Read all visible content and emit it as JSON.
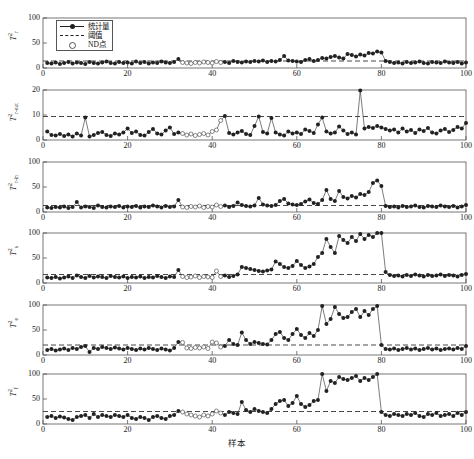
{
  "figure": {
    "xlabel": "样本",
    "caption": "",
    "x_ticks": [
      0,
      20,
      40,
      60,
      80,
      100
    ],
    "xlim": [
      0,
      100
    ],
    "legend": {
      "position": "top-left-panel-1",
      "entries": [
        {
          "key": "statistic",
          "label": "统计量",
          "symbol": "line-with-filled-circle"
        },
        {
          "key": "threshold",
          "label": "阈值",
          "symbol": "dashed-line"
        },
        {
          "key": "nd_point",
          "label": "ND点",
          "symbol": "open-circle"
        }
      ]
    },
    "colors": {
      "marker": "#222222",
      "line": "#444444",
      "threshold": "#333333",
      "axis": "#555555",
      "background": "#ffffff"
    }
  },
  "chart_data": [
    {
      "type": "line",
      "id": "panel-1",
      "title": "",
      "ylabel": "T²_r",
      "ylabel_base": "T",
      "ylabel_sup": "2",
      "ylabel_sub": "r",
      "xlabel": "样本",
      "ylim": [
        0,
        100
      ],
      "y_ticks": [
        0,
        50,
        100
      ],
      "xlim": [
        0,
        100
      ],
      "grid": false,
      "threshold": 14,
      "nd_range": [
        33,
        42
      ],
      "x": [
        1,
        2,
        3,
        4,
        5,
        6,
        7,
        8,
        9,
        10,
        11,
        12,
        13,
        14,
        15,
        16,
        17,
        18,
        19,
        20,
        21,
        22,
        23,
        24,
        25,
        26,
        27,
        28,
        29,
        30,
        31,
        32,
        33,
        34,
        35,
        36,
        37,
        38,
        39,
        40,
        41,
        42,
        43,
        44,
        45,
        46,
        47,
        48,
        49,
        50,
        51,
        52,
        53,
        54,
        55,
        56,
        57,
        58,
        59,
        60,
        61,
        62,
        63,
        64,
        65,
        66,
        67,
        68,
        69,
        70,
        71,
        72,
        73,
        74,
        75,
        76,
        77,
        78,
        79,
        80,
        81,
        82,
        83,
        84,
        85,
        86,
        87,
        88,
        89,
        90,
        91,
        92,
        93,
        94,
        95,
        96,
        97,
        98,
        99,
        100
      ],
      "values": [
        10,
        9,
        11,
        8,
        10,
        12,
        9,
        11,
        10,
        8,
        12,
        10,
        9,
        11,
        13,
        10,
        9,
        12,
        10,
        11,
        9,
        13,
        10,
        12,
        9,
        11,
        10,
        13,
        11,
        10,
        12,
        18,
        11,
        10,
        9,
        11,
        10,
        12,
        11,
        10,
        13,
        11,
        12,
        10,
        14,
        12,
        11,
        13,
        12,
        14,
        13,
        15,
        12,
        14,
        13,
        16,
        24,
        15,
        14,
        13,
        12,
        16,
        18,
        14,
        16,
        20,
        19,
        22,
        24,
        21,
        19,
        28,
        26,
        23,
        27,
        25,
        30,
        29,
        33,
        31,
        36,
        42,
        39,
        46,
        52,
        48,
        63,
        88,
        66,
        58,
        79,
        72,
        86,
        83,
        94,
        90,
        96,
        93,
        99,
        100
      ],
      "values_after_fault": [
        14,
        12,
        10,
        11,
        9,
        12,
        10,
        11,
        13,
        10,
        9,
        12,
        11,
        10,
        13,
        11,
        10,
        12,
        9,
        11
      ],
      "fault_index": 80
    },
    {
      "type": "line",
      "id": "panel-2",
      "title": "",
      "ylabel": "T²_r-out",
      "ylabel_base": "T",
      "ylabel_sup": "2",
      "ylabel_sub": "r-out",
      "xlabel": "样本",
      "ylim": [
        0,
        20
      ],
      "y_ticks": [
        0,
        10,
        20
      ],
      "xlim": [
        0,
        100
      ],
      "grid": false,
      "threshold": 9.4,
      "nd_range": [
        33,
        42
      ],
      "x": [
        1,
        2,
        3,
        4,
        5,
        6,
        7,
        8,
        9,
        10,
        11,
        12,
        13,
        14,
        15,
        16,
        17,
        18,
        19,
        20,
        21,
        22,
        23,
        24,
        25,
        26,
        27,
        28,
        29,
        30,
        31,
        32,
        33,
        34,
        35,
        36,
        37,
        38,
        39,
        40,
        41,
        42,
        43,
        44,
        45,
        46,
        47,
        48,
        49,
        50,
        51,
        52,
        53,
        54,
        55,
        56,
        57,
        58,
        59,
        60,
        61,
        62,
        63,
        64,
        65,
        66,
        67,
        68,
        69,
        70,
        71,
        72,
        73,
        74,
        75,
        76,
        77,
        78,
        79,
        80,
        81,
        82,
        83,
        84,
        85,
        86,
        87,
        88,
        89,
        90,
        91,
        92,
        93,
        94,
        95,
        96,
        97,
        98,
        99,
        100
      ],
      "values": [
        3.4,
        2.0,
        1.8,
        2.4,
        1.6,
        2.2,
        1.4,
        2.6,
        1.8,
        9.0,
        1.4,
        2.0,
        2.8,
        3.2,
        2.0,
        1.6,
        2.6,
        2.2,
        3.0,
        4.6,
        2.8,
        3.4,
        2.0,
        1.8,
        3.2,
        4.4,
        2.6,
        2.2,
        3.8,
        5.0,
        2.4,
        3.0,
        2.6,
        2.0,
        2.4,
        1.8,
        2.2,
        2.6,
        2.0,
        3.4,
        4.0,
        7.8,
        9.6,
        2.8,
        2.2,
        3.0,
        3.6,
        2.4,
        2.0,
        5.6,
        9.4,
        3.2,
        2.6,
        8.8,
        3.0,
        2.2,
        1.8,
        3.4,
        2.6,
        3.0,
        2.4,
        4.2,
        3.6,
        2.8,
        6.2,
        9.0,
        3.4,
        2.6,
        3.0,
        5.4,
        3.8,
        2.4,
        3.0,
        2.2,
        19.8,
        4.6,
        5.2,
        4.8,
        5.6,
        5.0,
        4.4,
        3.8,
        4.2,
        3.0,
        4.6,
        3.4,
        4.0,
        2.8,
        4.2,
        3.6,
        4.8,
        3.0,
        2.6,
        3.8,
        4.4,
        3.2,
        4.0,
        5.2,
        4.6,
        6.8
      ],
      "fault_index": null
    },
    {
      "type": "line",
      "id": "panel-3",
      "title": "",
      "ylabel": "T²_r-in",
      "ylabel_base": "T",
      "ylabel_sup": "2",
      "ylabel_sub": "r-in",
      "xlabel": "样本",
      "ylim": [
        0,
        100
      ],
      "y_ticks": [
        0,
        50,
        100
      ],
      "xlim": [
        0,
        100
      ],
      "grid": false,
      "threshold": 13,
      "nd_range": [
        33,
        42
      ],
      "x": [
        1,
        2,
        3,
        4,
        5,
        6,
        7,
        8,
        9,
        10,
        11,
        12,
        13,
        14,
        15,
        16,
        17,
        18,
        19,
        20,
        21,
        22,
        23,
        24,
        25,
        26,
        27,
        28,
        29,
        30,
        31,
        32,
        33,
        34,
        35,
        36,
        37,
        38,
        39,
        40,
        41,
        42,
        43,
        44,
        45,
        46,
        47,
        48,
        49,
        50,
        51,
        52,
        53,
        54,
        55,
        56,
        57,
        58,
        59,
        60,
        61,
        62,
        63,
        64,
        65,
        66,
        67,
        68,
        69,
        70,
        71,
        72,
        73,
        74,
        75,
        76,
        77,
        78,
        79,
        80,
        81,
        82,
        83,
        84,
        85,
        86,
        87,
        88,
        89,
        90,
        91,
        92,
        93,
        94,
        95,
        96,
        97,
        98,
        99,
        100
      ],
      "values": [
        9,
        8,
        10,
        9,
        11,
        8,
        10,
        20,
        9,
        11,
        10,
        8,
        13,
        10,
        9,
        11,
        10,
        12,
        9,
        11,
        10,
        12,
        9,
        11,
        10,
        13,
        11,
        9,
        12,
        10,
        11,
        24,
        10,
        9,
        11,
        10,
        12,
        9,
        11,
        10,
        14,
        11,
        13,
        10,
        12,
        19,
        14,
        12,
        11,
        13,
        28,
        15,
        13,
        12,
        14,
        22,
        26,
        17,
        15,
        14,
        16,
        21,
        25,
        18,
        16,
        24,
        44,
        26,
        22,
        42,
        30,
        27,
        32,
        29,
        36,
        34,
        40,
        58,
        63,
        52,
        12,
        10,
        11,
        9,
        12,
        10,
        11,
        13,
        10,
        9,
        12,
        11,
        10,
        13,
        11,
        10,
        12,
        9,
        11,
        14
      ],
      "fault_index": 80
    },
    {
      "type": "line",
      "id": "panel-4",
      "title": "",
      "ylabel": "T²_s",
      "ylabel_base": "T",
      "ylabel_sup": "2",
      "ylabel_sub": "s",
      "xlabel": "样本",
      "ylim": [
        0,
        100
      ],
      "y_ticks": [
        0,
        50,
        100
      ],
      "xlim": [
        0,
        100
      ],
      "grid": false,
      "threshold": 17,
      "nd_range": [
        33,
        42
      ],
      "x": [
        1,
        2,
        3,
        4,
        5,
        6,
        7,
        8,
        9,
        10,
        11,
        12,
        13,
        14,
        15,
        16,
        17,
        18,
        19,
        20,
        21,
        22,
        23,
        24,
        25,
        26,
        27,
        28,
        29,
        30,
        31,
        32,
        33,
        34,
        35,
        36,
        37,
        38,
        39,
        40,
        41,
        42,
        43,
        44,
        45,
        46,
        47,
        48,
        49,
        50,
        51,
        52,
        53,
        54,
        55,
        56,
        57,
        58,
        59,
        60,
        61,
        62,
        63,
        64,
        65,
        66,
        67,
        68,
        69,
        70,
        71,
        72,
        73,
        74,
        75,
        76,
        77,
        78,
        79,
        80,
        81,
        82,
        83,
        84,
        85,
        86,
        87,
        88,
        89,
        90,
        91,
        92,
        93,
        94,
        95,
        96,
        97,
        98,
        99,
        100
      ],
      "values": [
        11,
        10,
        12,
        9,
        11,
        13,
        10,
        15,
        12,
        10,
        14,
        11,
        13,
        12,
        10,
        14,
        12,
        11,
        13,
        10,
        12,
        11,
        13,
        10,
        12,
        11,
        14,
        12,
        10,
        13,
        12,
        26,
        13,
        11,
        12,
        14,
        11,
        13,
        12,
        11,
        24,
        13,
        15,
        12,
        14,
        17,
        32,
        30,
        28,
        26,
        24,
        23,
        25,
        27,
        43,
        38,
        32,
        30,
        34,
        44,
        36,
        30,
        33,
        38,
        52,
        60,
        88,
        72,
        60,
        94,
        86,
        80,
        92,
        84,
        98,
        88,
        96,
        92,
        100,
        100,
        22,
        16,
        14,
        15,
        13,
        16,
        14,
        17,
        15,
        13,
        16,
        14,
        15,
        17,
        14,
        16,
        15,
        13,
        16,
        18
      ],
      "fault_index": 80
    },
    {
      "type": "line",
      "id": "panel-5",
      "title": "",
      "ylabel": "T²_e",
      "ylabel_base": "T",
      "ylabel_sup": "2",
      "ylabel_sub": "e",
      "xlabel": "样本",
      "ylim": [
        0,
        100
      ],
      "y_ticks": [
        0,
        50,
        100
      ],
      "xlim": [
        0,
        100
      ],
      "grid": false,
      "threshold": 20,
      "nd_range": [
        33,
        42
      ],
      "x": [
        1,
        2,
        3,
        4,
        5,
        6,
        7,
        8,
        9,
        10,
        11,
        12,
        13,
        14,
        15,
        16,
        17,
        18,
        19,
        20,
        21,
        22,
        23,
        24,
        25,
        26,
        27,
        28,
        29,
        30,
        31,
        32,
        33,
        34,
        35,
        36,
        37,
        38,
        39,
        40,
        41,
        42,
        43,
        44,
        45,
        46,
        47,
        48,
        49,
        50,
        51,
        52,
        53,
        54,
        55,
        56,
        57,
        58,
        59,
        60,
        61,
        62,
        63,
        64,
        65,
        66,
        67,
        68,
        69,
        70,
        71,
        72,
        73,
        74,
        75,
        76,
        77,
        78,
        79,
        80,
        81,
        82,
        83,
        84,
        85,
        86,
        87,
        88,
        89,
        90,
        91,
        92,
        93,
        94,
        95,
        96,
        97,
        98,
        99,
        100
      ],
      "values": [
        10,
        12,
        9,
        11,
        13,
        10,
        14,
        12,
        16,
        18,
        6,
        14,
        12,
        16,
        14,
        12,
        15,
        13,
        11,
        14,
        12,
        10,
        13,
        11,
        14,
        12,
        10,
        13,
        11,
        9,
        14,
        26,
        25,
        14,
        13,
        15,
        14,
        16,
        13,
        26,
        24,
        16,
        18,
        30,
        22,
        20,
        45,
        30,
        22,
        26,
        24,
        22,
        21,
        30,
        42,
        46,
        34,
        30,
        42,
        52,
        40,
        34,
        44,
        38,
        50,
        98,
        62,
        72,
        96,
        82,
        74,
        76,
        86,
        92,
        76,
        88,
        80,
        92,
        98,
        20,
        12,
        11,
        13,
        10,
        12,
        14,
        11,
        13,
        10,
        12,
        14,
        11,
        13,
        10,
        12,
        13,
        11,
        14,
        12,
        18
      ],
      "fault_index": 80
    },
    {
      "type": "line",
      "id": "panel-6",
      "title": "",
      "ylabel": "T²_f",
      "ylabel_base": "T",
      "ylabel_sup": "2",
      "ylabel_sub": "f",
      "xlabel": "样本",
      "ylim": [
        0,
        100
      ],
      "y_ticks": [
        0,
        50,
        100
      ],
      "xlim": [
        0,
        100
      ],
      "grid": false,
      "threshold": 25,
      "nd_range": [
        33,
        42
      ],
      "x": [
        1,
        2,
        3,
        4,
        5,
        6,
        7,
        8,
        9,
        10,
        11,
        12,
        13,
        14,
        15,
        16,
        17,
        18,
        19,
        20,
        21,
        22,
        23,
        24,
        25,
        26,
        27,
        28,
        29,
        30,
        31,
        32,
        33,
        34,
        35,
        36,
        37,
        38,
        39,
        40,
        41,
        42,
        43,
        44,
        45,
        46,
        47,
        48,
        49,
        50,
        51,
        52,
        53,
        54,
        55,
        56,
        57,
        58,
        59,
        60,
        61,
        62,
        63,
        64,
        65,
        66,
        67,
        68,
        69,
        70,
        71,
        72,
        73,
        74,
        75,
        76,
        77,
        78,
        79,
        80,
        81,
        82,
        83,
        84,
        85,
        86,
        87,
        88,
        89,
        90,
        91,
        92,
        93,
        94,
        95,
        96,
        97,
        98,
        99,
        100
      ],
      "values": [
        14,
        16,
        12,
        15,
        13,
        10,
        8,
        14,
        16,
        18,
        12,
        20,
        14,
        18,
        16,
        14,
        18,
        16,
        14,
        18,
        12,
        10,
        14,
        12,
        8,
        14,
        16,
        12,
        10,
        16,
        18,
        26,
        24,
        20,
        18,
        16,
        14,
        18,
        16,
        20,
        26,
        22,
        18,
        24,
        22,
        20,
        44,
        28,
        24,
        30,
        26,
        24,
        22,
        30,
        40,
        46,
        48,
        36,
        42,
        56,
        40,
        34,
        38,
        46,
        48,
        100,
        66,
        86,
        82,
        94,
        90,
        88,
        92,
        96,
        86,
        92,
        88,
        94,
        100,
        24,
        18,
        16,
        20,
        18,
        16,
        20,
        18,
        22,
        16,
        14,
        20,
        18,
        22,
        16,
        18,
        20,
        16,
        22,
        18,
        24
      ],
      "fault_index": 80
    }
  ]
}
